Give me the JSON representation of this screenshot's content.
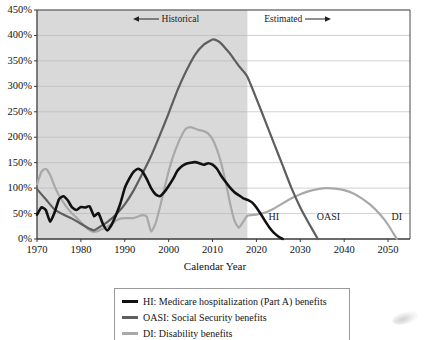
{
  "chart_data": {
    "type": "line",
    "title": "",
    "xlabel": "Calendar Year",
    "ylabel": "",
    "xlim": [
      1970,
      2055
    ],
    "ylim": [
      0,
      450
    ],
    "grid": true,
    "y_tick_labels": [
      "0%",
      "50%",
      "100%",
      "150%",
      "200%",
      "250%",
      "300%",
      "350%",
      "400%",
      "450%"
    ],
    "y_tick_values": [
      0,
      50,
      100,
      150,
      200,
      250,
      300,
      350,
      400,
      450
    ],
    "x_tick_labels": [
      "1970",
      "1980",
      "1990",
      "2000",
      "2010",
      "2020",
      "2030",
      "2040",
      "2050"
    ],
    "x_tick_values": [
      1970,
      1980,
      1990,
      2000,
      2010,
      2020,
      2030,
      2040,
      2050
    ],
    "historical_estimated_boundary": 2018,
    "annotations": [
      {
        "name": "historical-annotation",
        "text": "Historical",
        "arrow": "left",
        "x": 2005,
        "y": 430
      },
      {
        "name": "estimated-annotation",
        "text": "Estimated",
        "arrow": "right",
        "x": 2030,
        "y": 430
      }
    ],
    "legend_position": "below-plot",
    "series": [
      {
        "name": "HI",
        "label": "HI: Medicare hospitalization (Part A) benefits",
        "color": "#111111",
        "width": 2.6,
        "end_label": "HI",
        "end_label_x": 2023,
        "end_label_y": 42,
        "x": [
          1970,
          1971,
          1972,
          1973,
          1974,
          1975,
          1976,
          1977,
          1978,
          1979,
          1980,
          1981,
          1982,
          1983,
          1984,
          1985,
          1986,
          1987,
          1988,
          1989,
          1990,
          1991,
          1992,
          1993,
          1994,
          1995,
          1996,
          1997,
          1998,
          1999,
          2000,
          2001,
          2002,
          2003,
          2004,
          2005,
          2006,
          2007,
          2008,
          2009,
          2010,
          2011,
          2012,
          2013,
          2014,
          2015,
          2016,
          2017,
          2018,
          2019,
          2020,
          2021,
          2022,
          2023,
          2024,
          2025,
          2026
        ],
        "y": [
          48,
          62,
          57,
          34,
          52,
          78,
          84,
          76,
          62,
          57,
          63,
          62,
          64,
          45,
          51,
          30,
          17,
          28,
          47,
          70,
          100,
          118,
          132,
          138,
          133,
          118,
          100,
          88,
          84,
          92,
          104,
          118,
          134,
          143,
          148,
          150,
          151,
          149,
          146,
          149,
          146,
          138,
          124,
          112,
          101,
          92,
          86,
          80,
          77,
          72,
          62,
          49,
          35,
          22,
          12,
          5,
          0
        ]
      },
      {
        "name": "OASI",
        "label": "OASI: Social Security benefits",
        "color": "#5e5e5e",
        "width": 2.2,
        "end_label": "OASI",
        "end_label_x": 2034,
        "end_label_y": 42,
        "x": [
          1970,
          1972,
          1974,
          1976,
          1978,
          1980,
          1982,
          1983,
          1984,
          1986,
          1988,
          1990,
          1992,
          1994,
          1996,
          1998,
          2000,
          2002,
          2004,
          2006,
          2008,
          2010,
          2011,
          2012,
          2013,
          2014,
          2015,
          2016,
          2017,
          2018,
          2020,
          2022,
          2024,
          2026,
          2028,
          2030,
          2032,
          2034
        ],
        "y": [
          98,
          78,
          58,
          48,
          40,
          30,
          20,
          17,
          22,
          33,
          48,
          68,
          95,
          128,
          163,
          204,
          247,
          292,
          330,
          362,
          382,
          392,
          390,
          384,
          374,
          364,
          352,
          340,
          330,
          318,
          276,
          232,
          188,
          144,
          100,
          62,
          30,
          0
        ]
      },
      {
        "name": "DI",
        "label": "DI: Disability benefits",
        "color": "#a8a8a8",
        "width": 2.2,
        "end_label": "DI",
        "end_label_x": 2051,
        "end_label_y": 42,
        "x": [
          1970,
          1971,
          1972,
          1973,
          1974,
          1975,
          1976,
          1977,
          1978,
          1979,
          1980,
          1981,
          1982,
          1983,
          1984,
          1985,
          1986,
          1987,
          1988,
          1989,
          1990,
          1991,
          1992,
          1993,
          1994,
          1995,
          1996,
          1997,
          1998,
          1999,
          2000,
          2001,
          2002,
          2003,
          2004,
          2005,
          2006,
          2007,
          2008,
          2009,
          2010,
          2011,
          2012,
          2013,
          2014,
          2015,
          2016,
          2017,
          2018,
          2020,
          2022,
          2024,
          2026,
          2028,
          2030,
          2032,
          2034,
          2036,
          2038,
          2040,
          2042,
          2044,
          2046,
          2048,
          2050,
          2052
        ],
        "y": [
          108,
          132,
          138,
          126,
          104,
          86,
          72,
          60,
          50,
          42,
          33,
          24,
          17,
          14,
          16,
          20,
          24,
          29,
          36,
          40,
          41,
          41,
          41,
          44,
          47,
          44,
          15,
          30,
          62,
          98,
          133,
          162,
          185,
          204,
          217,
          220,
          217,
          214,
          212,
          207,
          196,
          176,
          148,
          112,
          70,
          36,
          22,
          34,
          46,
          48,
          52,
          60,
          70,
          80,
          88,
          94,
          98,
          100,
          99,
          96,
          90,
          80,
          67,
          50,
          28,
          0
        ]
      }
    ]
  },
  "legend": {
    "items": [
      {
        "label": "HI: Medicare hospitalization (Part A) benefits",
        "color": "#111111"
      },
      {
        "label": "OASI: Social Security benefits",
        "color": "#5e5e5e"
      },
      {
        "label": "DI: Disability benefits",
        "color": "#a8a8a8"
      }
    ]
  }
}
